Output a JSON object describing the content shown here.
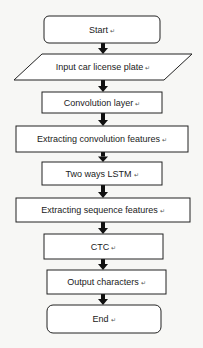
{
  "diagram": {
    "type": "flowchart",
    "direction": "top-to-bottom",
    "stroke_color": "#222222",
    "fill_color": "#ffffff",
    "return_mark": "↵",
    "nodes": [
      {
        "id": "start",
        "shape": "terminal",
        "label": "Start"
      },
      {
        "id": "input",
        "shape": "parallelogram",
        "label": "Input car license plate"
      },
      {
        "id": "conv",
        "shape": "process",
        "label": "Convolution layer"
      },
      {
        "id": "extract_conv",
        "shape": "process",
        "label": "Extracting convolution features"
      },
      {
        "id": "lstm",
        "shape": "process",
        "label": "Two ways LSTM"
      },
      {
        "id": "extract_seq",
        "shape": "process",
        "label": "Extracting sequence features"
      },
      {
        "id": "ctc",
        "shape": "process",
        "label": "CTC"
      },
      {
        "id": "output",
        "shape": "process",
        "label": "Output characters"
      },
      {
        "id": "end",
        "shape": "terminal",
        "label": "End"
      }
    ],
    "edges": [
      {
        "from": "start",
        "to": "input"
      },
      {
        "from": "input",
        "to": "conv"
      },
      {
        "from": "conv",
        "to": "extract_conv"
      },
      {
        "from": "extract_conv",
        "to": "lstm"
      },
      {
        "from": "lstm",
        "to": "extract_seq"
      },
      {
        "from": "extract_seq",
        "to": "ctc"
      },
      {
        "from": "ctc",
        "to": "output"
      },
      {
        "from": "output",
        "to": "end"
      }
    ]
  }
}
